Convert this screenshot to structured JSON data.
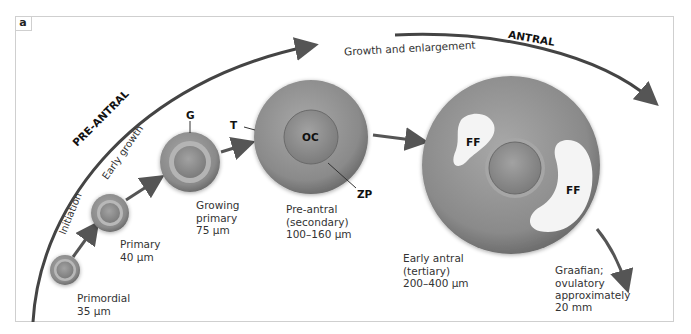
{
  "panel_label": "a",
  "phases": {
    "pre_antral": "PRE-ANTRAL",
    "antral": "ANTRAL",
    "initiation": "Initiation",
    "early_growth": "Early growth",
    "growth_enlargement": "Growth and enlargement"
  },
  "stages": [
    {
      "name": "Primordial",
      "size": "35 μm"
    },
    {
      "name": "Primary",
      "size": "40 μm"
    },
    {
      "name": "Growing\nprimary",
      "size": "75 μm"
    },
    {
      "name": "Pre-antral\n(secondary)",
      "size": "100–160 μm"
    },
    {
      "name": "Early antral\n(tertiary)",
      "size": "200–400 μm"
    },
    {
      "name": "Graafian;\novulatory\napproximately",
      "size": "20 mm"
    }
  ],
  "structure_labels": {
    "granulosa": "G",
    "theca": "T",
    "oocyte": "OC",
    "zona_pellucida": "ZP",
    "follicular_fluid_1": "FF",
    "follicular_fluid_2": "FF"
  },
  "colors": {
    "arrow": "#555555",
    "follicle_outer": "#8c8c8c",
    "follicle_inner": "#9a9a9a",
    "fluid": "#f4f4f4",
    "border": "#cfcfcf"
  }
}
